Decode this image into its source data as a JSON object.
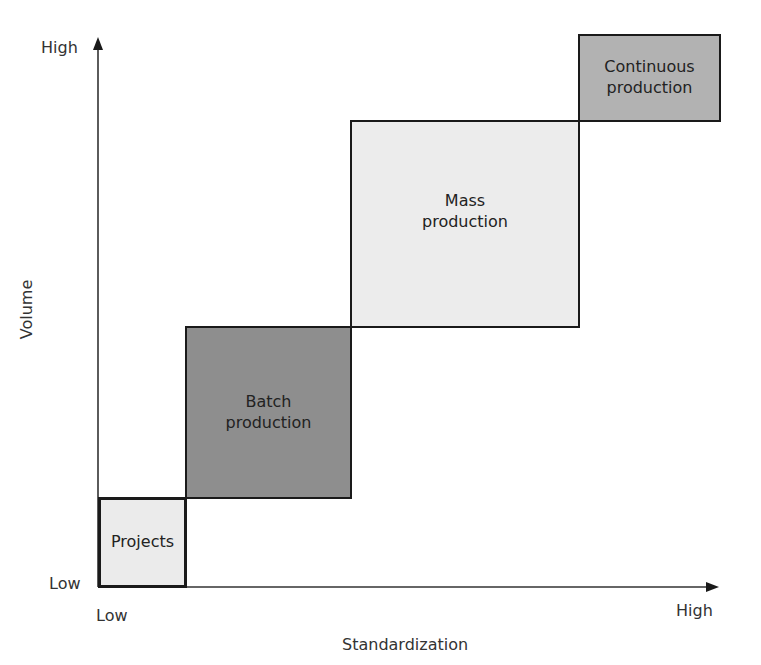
{
  "diagram": {
    "x_axis": {
      "label": "Standardization",
      "low": "Low",
      "high": "High"
    },
    "y_axis": {
      "label": "Volume",
      "low": "Low",
      "high": "High"
    },
    "boxes": [
      {
        "id": "projects",
        "label": "Projects",
        "fill": "#ebebeb"
      },
      {
        "id": "batch",
        "label_line1": "Batch",
        "label_line2": "production",
        "fill": "#8e8e8e"
      },
      {
        "id": "mass",
        "label_line1": "Mass",
        "label_line2": "production",
        "fill": "#ececec"
      },
      {
        "id": "continuous",
        "label_line1": "Continuous",
        "label_line2": "production",
        "fill": "#b2b2b2"
      }
    ]
  }
}
